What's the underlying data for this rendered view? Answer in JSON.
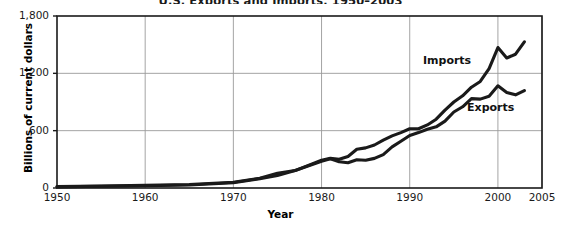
{
  "chart_data": {
    "type": "line",
    "title": "U.S. Exports and Imports, 1950–2003",
    "xlabel": "Year",
    "ylabel": "Billions of current dollars",
    "xlim": [
      1950,
      2005
    ],
    "ylim": [
      0,
      1800
    ],
    "grid": true,
    "legend_position": "inline-annotation",
    "xticks": [
      "1950",
      "1960",
      "1970",
      "1980",
      "1990",
      "2000",
      "2005"
    ],
    "xtick_values": [
      1950,
      1960,
      1970,
      1980,
      1990,
      2000,
      2005
    ],
    "yticks": [
      "0",
      "600",
      "1,200",
      "1,800"
    ],
    "ytick_values": [
      0,
      600,
      1200,
      1800
    ],
    "x": [
      1950,
      1955,
      1960,
      1965,
      1970,
      1973,
      1975,
      1977,
      1980,
      1981,
      1982,
      1983,
      1984,
      1985,
      1986,
      1987,
      1988,
      1989,
      1990,
      1991,
      1992,
      1993,
      1994,
      1995,
      1996,
      1997,
      1998,
      1999,
      2000,
      2001,
      2002,
      2003
    ],
    "series": [
      {
        "name": "Imports",
        "label": "Imports",
        "color": "#1a1a1a",
        "values": [
          12,
          18,
          23,
          32,
          55,
          98,
          132,
          182,
          290,
          310,
          300,
          330,
          405,
          420,
          450,
          500,
          545,
          580,
          620,
          620,
          660,
          720,
          815,
          900,
          965,
          1055,
          1115,
          1250,
          1470,
          1360,
          1400,
          1530
        ]
      },
      {
        "name": "Exports",
        "label": "Exports",
        "color": "#1a1a1a",
        "values": [
          14,
          20,
          27,
          37,
          60,
          102,
          155,
          184,
          280,
          305,
          275,
          265,
          295,
          290,
          310,
          350,
          430,
          490,
          550,
          580,
          615,
          640,
          700,
          795,
          850,
          935,
          930,
          960,
          1070,
          1000,
          975,
          1020
        ]
      }
    ],
    "annotations": [
      {
        "text": "Imports",
        "x": 1991.5,
        "y": 1330
      },
      {
        "text": "Exports",
        "x": 1996.5,
        "y": 835
      }
    ]
  }
}
